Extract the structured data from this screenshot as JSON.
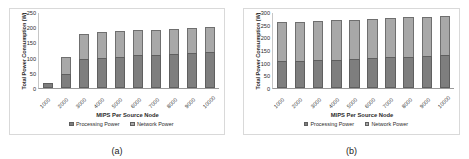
{
  "figure": {
    "panels": [
      {
        "id": "a",
        "caption": "(a)",
        "chart_data": {
          "type": "bar",
          "stacked": true,
          "title": "",
          "xlabel": "MIPS Per Source Node",
          "ylabel": "Total Power Consumption (W)",
          "ylim": [
            0,
            250
          ],
          "yticks": [
            250,
            200,
            150,
            100,
            50,
            0
          ],
          "grid": false,
          "legend_position": "bottom",
          "categories": [
            "1000",
            "2000",
            "3000",
            "4000",
            "5000",
            "6000",
            "7000",
            "8000",
            "9000",
            "10000"
          ],
          "series": [
            {
              "name": "Processing Power",
              "color": "#7e7e7e",
              "values": [
                18,
                45,
                97,
                100,
                103,
                107,
                110,
                111,
                115,
                119
              ]
            },
            {
              "name": "Network Power",
              "color": "#a8a8a8",
              "values": [
                0,
                57,
                82,
                83,
                84,
                83,
                82,
                84,
                83,
                82
              ]
            }
          ],
          "totals": [
            18,
            102,
            179,
            183,
            187,
            190,
            192,
            195,
            198,
            201
          ]
        }
      },
      {
        "id": "b",
        "caption": "(b)",
        "chart_data": {
          "type": "bar",
          "stacked": true,
          "title": "",
          "xlabel": "MIPS Per Source Node",
          "ylabel": "Total Power Consumption (W)",
          "ylim": [
            0,
            300
          ],
          "yticks": [
            300,
            250,
            200,
            150,
            100,
            50,
            0
          ],
          "grid": false,
          "legend_position": "bottom",
          "categories": [
            "1000",
            "2000",
            "3000",
            "4000",
            "5000",
            "6000",
            "7000",
            "8000",
            "9000",
            "10000"
          ],
          "series": [
            {
              "name": "Processing Power",
              "color": "#7e7e7e",
              "values": [
                105,
                107,
                110,
                112,
                115,
                118,
                121,
                124,
                126,
                130
              ]
            },
            {
              "name": "Network Power",
              "color": "#a8a8a8",
              "values": [
                155,
                155,
                155,
                155,
                155,
                154,
                155,
                155,
                155,
                153
              ]
            }
          ],
          "totals": [
            260,
            262,
            265,
            267,
            270,
            272,
            276,
            279,
            281,
            283
          ]
        }
      }
    ],
    "legend": {
      "processing_label": "Processing Power",
      "network_label": "Network Power"
    },
    "colors": {
      "processing": "#7e7e7e",
      "network": "#a8a8a8",
      "frame": "#d9d9d9",
      "axis": "#9a9a9a"
    }
  }
}
